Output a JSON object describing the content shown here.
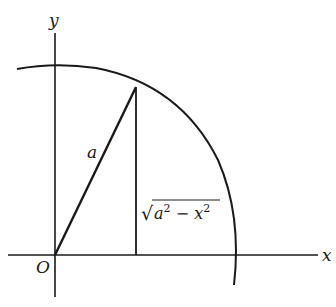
{
  "diagram": {
    "type": "quarter-circle geometry",
    "colors": {
      "stroke": "#1a1a1a",
      "background": "#ffffff"
    },
    "labels": {
      "y_axis": "y",
      "x_axis": "x",
      "origin": "O",
      "radius": "a",
      "height_radical": "√",
      "height_radicand_a": "a",
      "height_exp1": "2",
      "height_minus": " − ",
      "height_radicand_x": "x",
      "height_exp2": "2"
    },
    "elements": [
      {
        "id": "x-axis",
        "kind": "line"
      },
      {
        "id": "y-axis",
        "kind": "line"
      },
      {
        "id": "circle-arc",
        "kind": "arc",
        "description": "circle of radius a centered at O"
      },
      {
        "id": "radius-segment",
        "kind": "line",
        "from": "O",
        "to": "point on arc",
        "label": "a"
      },
      {
        "id": "vertical-segment",
        "kind": "line",
        "from": "point on arc",
        "to": "x-axis",
        "label": "√(a² − x²)"
      }
    ]
  }
}
